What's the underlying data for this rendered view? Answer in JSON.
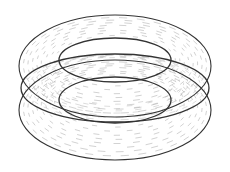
{
  "figure": {
    "stroke_color": "#333333",
    "field_color": "#8a8a8a",
    "background": "#ffffff",
    "outer_upper": {
      "cx": 115,
      "cy": 66,
      "rx": 96,
      "ry": 51
    },
    "outer_lower": {
      "cx": 115,
      "cy": 110,
      "rx": 96,
      "ry": 50
    },
    "equator_lens": {
      "cx": 115,
      "cy": 88,
      "rx": 94,
      "ry": 34
    },
    "inner_upper": {
      "cx": 115,
      "cy": 60,
      "rx": 56,
      "ry": 22
    },
    "inner_lower": {
      "cx": 115,
      "cy": 100,
      "rx": 56,
      "ry": 23
    },
    "field_rings": 9
  },
  "caption": ""
}
